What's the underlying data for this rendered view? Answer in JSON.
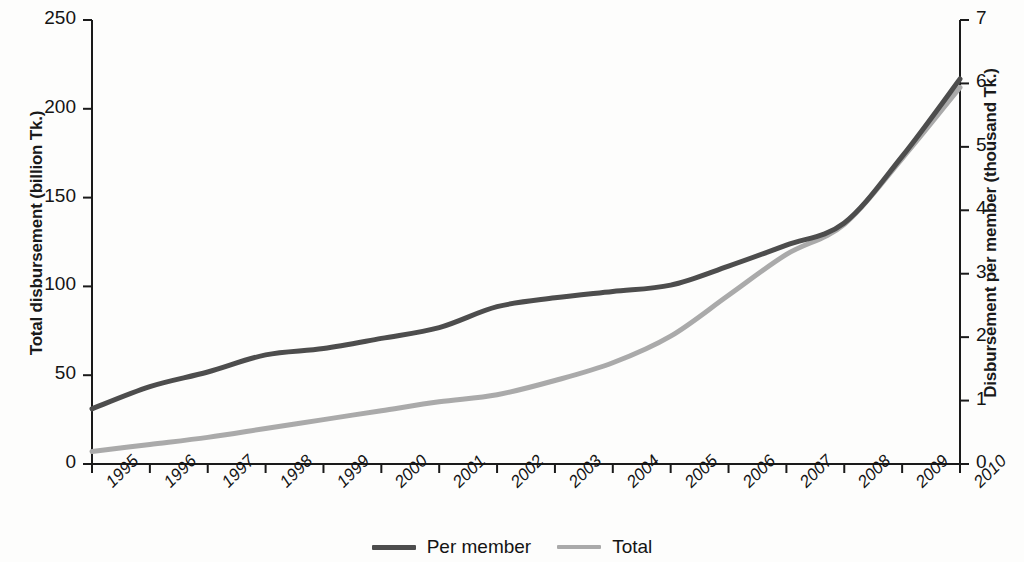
{
  "chart_data": {
    "type": "line",
    "title": "",
    "xlabel": "",
    "ylabel": "Total disbursement (billion Tk.)",
    "ylabel_right": "Disbursement per member (thousand Tk.)",
    "grid": false,
    "legend_position": "bottom-center",
    "x": [
      1995,
      1996,
      1997,
      1998,
      1999,
      2000,
      2001,
      2002,
      2003,
      2004,
      2005,
      2006,
      2007,
      2008,
      2009,
      2010
    ],
    "categories": [
      "1995",
      "1996",
      "1997",
      "1998",
      "1999",
      "2000",
      "2001",
      "2002",
      "2003",
      "2004",
      "2005",
      "2006",
      "2007",
      "2008",
      "2009",
      "2010"
    ],
    "ylim": [
      0,
      250
    ],
    "yticks": [
      0,
      50,
      100,
      150,
      200,
      250
    ],
    "ylim_right": [
      0,
      7
    ],
    "yticks_right": [
      0,
      1,
      2,
      3,
      4,
      5,
      6,
      7
    ],
    "series": [
      {
        "name": "Per member",
        "axis": "right",
        "color": "#4d4d4d",
        "units": "thousand Tk.",
        "values": [
          0.87,
          1.22,
          1.45,
          1.72,
          1.82,
          1.98,
          2.15,
          2.48,
          2.62,
          2.72,
          2.82,
          3.12,
          3.45,
          3.8,
          4.85,
          6.07
        ],
        "values_left_scale": [
          31,
          44,
          52,
          61,
          65,
          71,
          77,
          88,
          93,
          97,
          101,
          111,
          123,
          135,
          173,
          217
        ]
      },
      {
        "name": "Total",
        "axis": "left",
        "color": "#aaaaaa",
        "units": "billion Tk.",
        "values": [
          7,
          11,
          15,
          20,
          25,
          30,
          35,
          39,
          47,
          57,
          72,
          95,
          118,
          135,
          172,
          212
        ]
      }
    ]
  },
  "axes": {
    "left_title": "Total disbursement (billion Tk.)",
    "right_title": "Disbursement per member (thousand Tk.)",
    "left_ticks": [
      "0",
      "50",
      "100",
      "150",
      "200",
      "250"
    ],
    "right_ticks": [
      "0",
      "1",
      "2",
      "3",
      "4",
      "5",
      "6",
      "7"
    ],
    "x_ticks": [
      "1995",
      "1996",
      "1997",
      "1998",
      "1999",
      "2000",
      "2001",
      "2002",
      "2003",
      "2004",
      "2005",
      "2006",
      "2007",
      "2008",
      "2009",
      "2010"
    ]
  },
  "legend": {
    "items": [
      {
        "label": "Per member",
        "color": "#4d4d4d"
      },
      {
        "label": "Total",
        "color": "#aaaaaa"
      }
    ]
  },
  "colors": {
    "per_member": "#4d4d4d",
    "total": "#aaaaaa",
    "axis": "#1a1a1a",
    "background": "#fdfdfc"
  }
}
